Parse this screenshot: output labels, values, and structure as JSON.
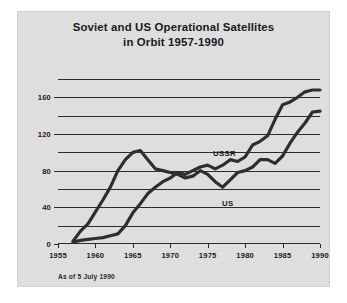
{
  "figure": {
    "background_color": "#ffffff",
    "panel_color": "#dedede",
    "ink_color": "#2e2e2e"
  },
  "title": {
    "line1": "Soviet and US Operational Satellites",
    "line2": "in Orbit 1957-1990"
  },
  "footnote": "As of 5 July 1990",
  "annotations": {
    "ussr": "USSR",
    "us": "US"
  },
  "axes": {
    "y_ticks": [
      "0",
      "40",
      "80",
      "120",
      "160"
    ],
    "x_ticks": [
      "1955",
      "1960",
      "1965",
      "1970",
      "1975",
      "1980",
      "1985",
      "1990"
    ]
  },
  "chart_data": {
    "type": "line",
    "title": "Soviet and US Operational Satellites in Orbit 1957-1990",
    "subtitle": "As of 5 July 1990",
    "xlabel": "",
    "ylabel": "",
    "xlim": [
      1955,
      1990
    ],
    "ylim": [
      0,
      180
    ],
    "y_tick_labels": [
      0,
      40,
      80,
      120,
      160
    ],
    "y_gridline_values": [
      0,
      20,
      40,
      60,
      80,
      100,
      120,
      140,
      160,
      180
    ],
    "x_tick_labels": [
      1955,
      1960,
      1965,
      1970,
      1975,
      1980,
      1985,
      1990
    ],
    "grid": true,
    "legend": "inline-annotations",
    "x": [
      1957,
      1958,
      1959,
      1960,
      1961,
      1962,
      1963,
      1964,
      1965,
      1966,
      1967,
      1968,
      1969,
      1970,
      1971,
      1972,
      1973,
      1974,
      1975,
      1976,
      1977,
      1978,
      1979,
      1980,
      1981,
      1982,
      1983,
      1984,
      1985,
      1986,
      1987,
      1988,
      1989,
      1990
    ],
    "series": [
      {
        "name": "USSR",
        "values": [
          2,
          4,
          5,
          6,
          7,
          9,
          11,
          20,
          34,
          44,
          55,
          62,
          68,
          72,
          78,
          76,
          80,
          84,
          86,
          82,
          86,
          92,
          90,
          95,
          108,
          112,
          118,
          136,
          152,
          155,
          160,
          166,
          168,
          168
        ]
      },
      {
        "name": "US",
        "values": [
          3,
          14,
          22,
          35,
          48,
          62,
          80,
          92,
          100,
          102,
          92,
          82,
          80,
          78,
          76,
          72,
          74,
          80,
          76,
          68,
          62,
          70,
          78,
          80,
          84,
          92,
          92,
          88,
          96,
          110,
          122,
          132,
          144,
          145
        ]
      }
    ]
  }
}
